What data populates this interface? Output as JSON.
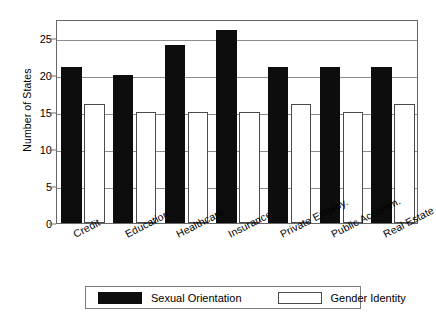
{
  "chart_data": {
    "type": "bar",
    "title": "",
    "xlabel": "",
    "ylabel": "Number of States",
    "ylim": [
      0,
      27.5
    ],
    "yticks": [
      0,
      5,
      10,
      15,
      20,
      25
    ],
    "ytick_labels": [
      "0",
      "5",
      "10",
      "15",
      "20",
      "25"
    ],
    "grid": true,
    "legend_position": "bottom",
    "categories": [
      "Credit",
      "Education",
      "Healthcare",
      "Insurance",
      "Private Employ.",
      "Public Accomm.",
      "Real Estate"
    ],
    "series": [
      {
        "name": "Sexual Orientation",
        "color": "#0d0d0d",
        "values": [
          21,
          20,
          24,
          26,
          21,
          21,
          21
        ]
      },
      {
        "name": "Gender Identity",
        "color": "#ffffff",
        "values": [
          16,
          15,
          15,
          15,
          16,
          15,
          16
        ]
      }
    ]
  },
  "legend": {
    "entries": [
      {
        "label": "Sexual Orientation",
        "swatch": "filled"
      },
      {
        "label": "Gender Identity",
        "swatch": "hollow"
      }
    ]
  }
}
